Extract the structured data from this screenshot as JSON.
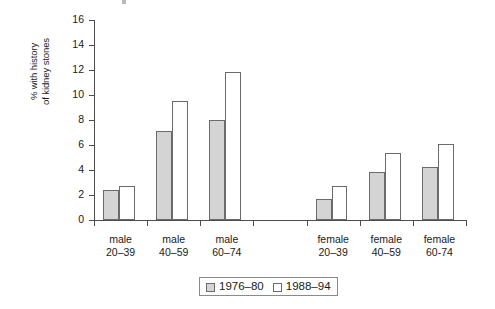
{
  "chart_data": {
    "type": "bar",
    "title": "",
    "xlabel": "",
    "ylabel_line1": "% with history",
    "ylabel_line2": "of kidney stones",
    "ylim": [
      0,
      16
    ],
    "yticks": [
      0,
      2,
      4,
      6,
      8,
      10,
      12,
      14,
      16
    ],
    "grid": false,
    "legend_position": "bottom-center",
    "categories": [
      "male 20–39",
      "male 40–59",
      "male 60–74",
      "female 20–39",
      "female 40–59",
      "female 60-74"
    ],
    "category_lines": [
      [
        "male",
        "20–39"
      ],
      [
        "male",
        "40–59"
      ],
      [
        "male",
        "60–74"
      ],
      [
        "female",
        "20–39"
      ],
      [
        "female",
        "40–59"
      ],
      [
        "female",
        "60-74"
      ]
    ],
    "series": [
      {
        "name": "1976–80",
        "color": "#d4d4d4",
        "values": [
          2.4,
          7.1,
          8.0,
          1.7,
          3.85,
          4.25
        ]
      },
      {
        "name": "1988–94",
        "color": "#ffffff",
        "values": [
          2.7,
          9.5,
          11.85,
          2.7,
          5.4,
          6.1
        ]
      }
    ]
  },
  "legend": {
    "items": [
      {
        "label": "1976–80",
        "swatch": "gray"
      },
      {
        "label": "1988–94",
        "swatch": "white"
      }
    ]
  }
}
